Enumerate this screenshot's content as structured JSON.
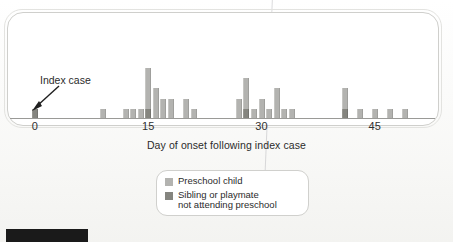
{
  "figure": {
    "index_annotation": "Index case",
    "axis_title": "Day of onset following index case"
  },
  "legend": {
    "items": [
      {
        "label": "Preschool child",
        "color": "#b3b3b0",
        "swatch": "light-gray-swatch"
      },
      {
        "label": "Sibling or playmate\nnot attending preschool",
        "color": "#85857f",
        "swatch": "dark-gray-swatch"
      }
    ]
  },
  "chart_data": {
    "type": "bar",
    "title": "",
    "subtitle": "",
    "xlabel": "Day of onset following index case",
    "ylabel": "",
    "stacked": true,
    "grid": false,
    "legend_position": "below-plot",
    "xlim": [
      -2,
      52
    ],
    "ylim": [
      0,
      6
    ],
    "tick_labels": [
      "0",
      "15",
      "30",
      "45"
    ],
    "tick_values": [
      0,
      15,
      30,
      45
    ],
    "series": [
      {
        "name": "Preschool child",
        "color": "#b3b3b0",
        "values": [
          0,
          0,
          0,
          0,
          0,
          0,
          0,
          0,
          0,
          1,
          0,
          0,
          1,
          1,
          1,
          4,
          3,
          2,
          2,
          0,
          2,
          1,
          0,
          0,
          0,
          0,
          0,
          2,
          3,
          1,
          2,
          1,
          3,
          1,
          1,
          0,
          0,
          0,
          0,
          0,
          0,
          2,
          0,
          1,
          0,
          1,
          0,
          1,
          0,
          1
        ]
      },
      {
        "name": "Sibling or playmate not attending preschool",
        "color": "#85857f",
        "values": [
          1,
          0,
          0,
          0,
          0,
          0,
          0,
          0,
          0,
          0,
          0,
          0,
          0,
          0,
          0,
          1,
          0,
          0,
          0,
          0,
          0,
          0,
          0,
          0,
          0,
          0,
          0,
          0,
          1,
          0,
          0,
          0,
          0,
          0,
          0,
          0,
          0,
          0,
          0,
          0,
          0,
          1,
          0,
          0,
          0,
          0,
          0,
          0,
          0,
          0
        ]
      }
    ],
    "x": [
      0,
      1,
      2,
      3,
      4,
      5,
      6,
      7,
      8,
      9,
      10,
      11,
      12,
      13,
      14,
      15,
      16,
      17,
      18,
      19,
      20,
      21,
      22,
      23,
      24,
      25,
      26,
      27,
      28,
      29,
      30,
      31,
      32,
      33,
      34,
      35,
      36,
      37,
      38,
      39,
      40,
      41,
      42,
      43,
      44,
      45,
      46,
      47,
      48,
      49
    ],
    "annotations": [
      {
        "text": "Index case",
        "points_to_day": 0
      }
    ]
  }
}
